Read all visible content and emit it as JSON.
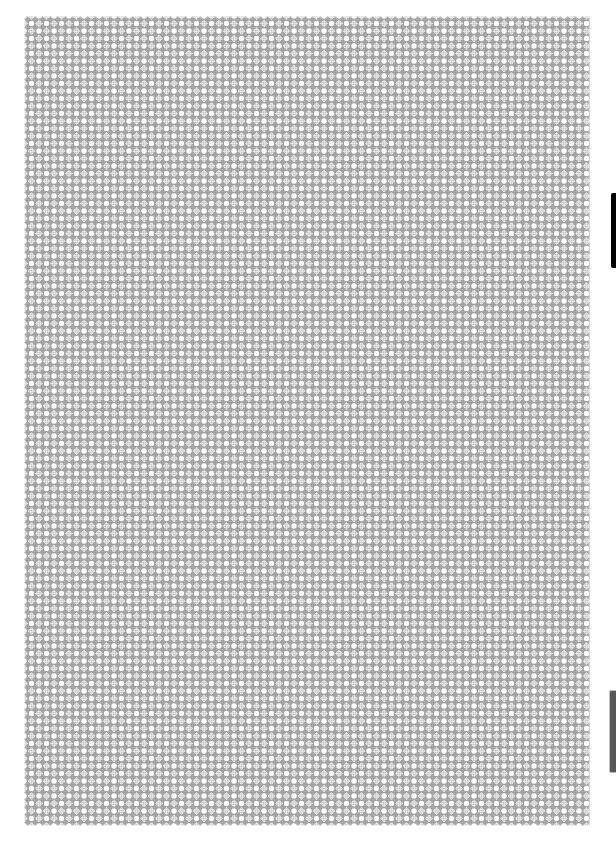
{
  "canvas": {
    "width": 616,
    "height": 850,
    "background": "#ffffff"
  },
  "page": {
    "pattern": "diamond-lattice",
    "colors": {
      "base": "#c8c8c8",
      "diamond": "#8a8a8a",
      "dot": "#ffffff"
    },
    "pattern_period_px": 15
  },
  "side_tabs": [
    {
      "name": "top-tab",
      "color": "#000000"
    },
    {
      "name": "bottom-tab",
      "color": "#575757"
    }
  ]
}
